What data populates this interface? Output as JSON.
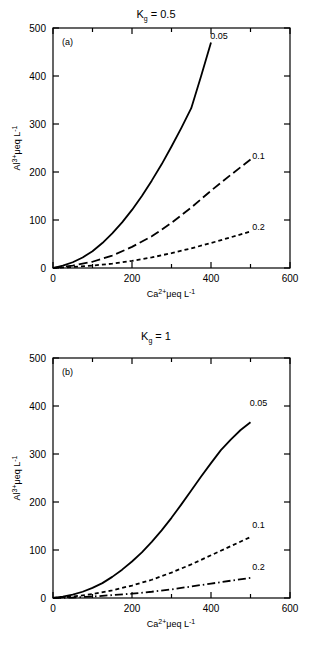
{
  "figure": {
    "background": "#ffffff",
    "line_color": "#000000",
    "axis_color": "#000000"
  },
  "chart_data": [
    {
      "type": "line",
      "panel_tag": "(a)",
      "title": "Kg = 0.5",
      "title_parts": {
        "base": "K",
        "subscript": "g",
        "equals": " = ",
        "value": "0.5"
      },
      "xlabel": "Ca2+ μeq L-1",
      "xlabel_parts": {
        "species": "Ca",
        "charge": "2+",
        "units": "μeq L",
        "exponent": "-1"
      },
      "ylabel": "Al3+ μeq L-1",
      "ylabel_parts": {
        "species": "Al",
        "charge": "3+",
        "units": "μeq L",
        "exponent": "-1"
      },
      "xlim": [
        0,
        600
      ],
      "ylim": [
        0,
        500
      ],
      "xticks": [
        0,
        100,
        200,
        300,
        400,
        500,
        600
      ],
      "xtick_labels": [
        "0",
        "",
        "200",
        "",
        "400",
        "",
        "600"
      ],
      "yticks": [
        0,
        100,
        200,
        300,
        400,
        500
      ],
      "ytick_labels": [
        "0",
        "100",
        "200",
        "300",
        "400",
        "500"
      ],
      "grid": false,
      "legend": "inline-end-labels",
      "series": [
        {
          "name": "0.05",
          "label": "0.05",
          "dash": "solid",
          "label_x": 420,
          "label_y": 478,
          "x": [
            0,
            25,
            50,
            75,
            100,
            125,
            150,
            175,
            200,
            225,
            250,
            275,
            300,
            325,
            350,
            375,
            400
          ],
          "y": [
            0,
            5,
            12,
            22,
            35,
            52,
            72,
            95,
            121,
            150,
            182,
            216,
            253,
            292,
            333,
            400,
            470
          ]
        },
        {
          "name": "0.1",
          "label": "0.1",
          "dash": "long-dash",
          "label_x": 520,
          "label_y": 228,
          "x": [
            0,
            50,
            100,
            150,
            200,
            250,
            300,
            350,
            400,
            450,
            500
          ],
          "y": [
            0,
            5,
            13,
            26,
            44,
            66,
            94,
            126,
            161,
            194,
            226
          ]
        },
        {
          "name": "0.2",
          "label": "0.2",
          "dash": "short-dash",
          "label_x": 520,
          "label_y": 79,
          "x": [
            0,
            50,
            100,
            150,
            200,
            250,
            300,
            350,
            400,
            450,
            500
          ],
          "y": [
            0,
            2,
            5,
            9,
            15,
            22,
            31,
            41,
            52,
            64,
            76
          ]
        }
      ]
    },
    {
      "type": "line",
      "panel_tag": "(b)",
      "title": "Kg = 1",
      "title_parts": {
        "base": "K",
        "subscript": "g",
        "equals": " = ",
        "value": "1"
      },
      "xlabel": "Ca2+ μeq L-1",
      "xlabel_parts": {
        "species": "Ca",
        "charge": "2+",
        "units": "μeq L",
        "exponent": "-1"
      },
      "ylabel": "Al3+ μeq L-1",
      "ylabel_parts": {
        "species": "Al",
        "charge": "3+",
        "units": "μeq L",
        "exponent": "-1"
      },
      "xlim": [
        0,
        600
      ],
      "ylim": [
        0,
        500
      ],
      "xticks": [
        0,
        100,
        200,
        300,
        400,
        500,
        600
      ],
      "xtick_labels": [
        "0",
        "",
        "200",
        "",
        "400",
        "",
        "600"
      ],
      "yticks": [
        0,
        100,
        200,
        300,
        400,
        500
      ],
      "ytick_labels": [
        "0",
        "100",
        "200",
        "300",
        "400",
        "500"
      ],
      "grid": false,
      "legend": "inline-end-labels",
      "series": [
        {
          "name": "0.05",
          "label": "0.05",
          "dash": "solid",
          "label_x": 520,
          "label_y": 400,
          "x": [
            0,
            25,
            50,
            75,
            100,
            125,
            150,
            175,
            200,
            225,
            250,
            275,
            300,
            325,
            350,
            375,
            400,
            425,
            450,
            475,
            500
          ],
          "y": [
            0,
            3,
            7,
            13,
            21,
            31,
            44,
            59,
            76,
            95,
            117,
            141,
            167,
            195,
            224,
            253,
            281,
            308,
            330,
            350,
            366
          ]
        },
        {
          "name": "0.1",
          "label": "0.1",
          "dash": "short-dash",
          "label_x": 520,
          "label_y": 145,
          "x": [
            0,
            50,
            100,
            150,
            200,
            250,
            300,
            350,
            400,
            450,
            500
          ],
          "y": [
            0,
            3,
            8,
            16,
            26,
            38,
            53,
            70,
            89,
            108,
            127
          ]
        },
        {
          "name": "0.2",
          "label": "0.2",
          "dash": "dash-dot",
          "label_x": 520,
          "label_y": 58,
          "x": [
            0,
            50,
            100,
            150,
            200,
            250,
            300,
            350,
            400,
            450,
            500
          ],
          "y": [
            0,
            1,
            3,
            6,
            9,
            13,
            18,
            24,
            30,
            36,
            42
          ]
        }
      ]
    }
  ]
}
